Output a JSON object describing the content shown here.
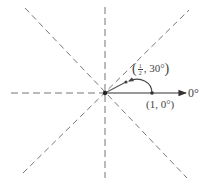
{
  "diagram": {
    "type": "polar-rotation",
    "origin": {
      "x": 105,
      "y": 93
    },
    "axis_label": "0°",
    "reference_lines": [
      "0°",
      "45°",
      "90°",
      "135°"
    ],
    "points": [
      {
        "name": "point-1-0",
        "r": "1",
        "theta": "0°",
        "label": "(1, 0°)"
      },
      {
        "name": "point-half-30",
        "r_numerator": "1",
        "r_denominator": "2",
        "theta": "30°",
        "label_open": "(",
        "label_theta": ", 30°",
        "label_close": ")"
      }
    ],
    "colors": {
      "line": "#555555",
      "dashed": "#777777",
      "text": "#444444"
    }
  }
}
